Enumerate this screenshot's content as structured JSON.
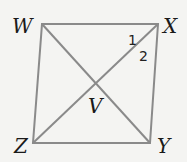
{
  "diagram": {
    "type": "quadrilateral with diagonals",
    "vertices": {
      "W": {
        "label": "W",
        "x": 42,
        "y": 24
      },
      "X": {
        "label": "X",
        "x": 158,
        "y": 24
      },
      "Y": {
        "label": "Y",
        "x": 150,
        "y": 143
      },
      "Z": {
        "label": "Z",
        "x": 33,
        "y": 143
      }
    },
    "intersection": {
      "label": "V"
    },
    "angle_labels": [
      "1",
      "2"
    ],
    "line_color": "#8a8a8a",
    "text_color": "#1a1a1a"
  }
}
